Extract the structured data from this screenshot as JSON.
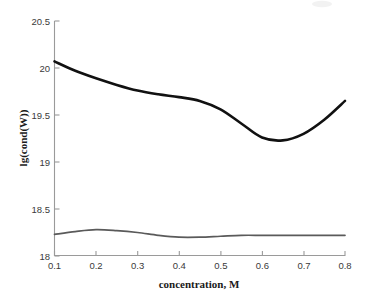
{
  "chart_data": {
    "type": "line",
    "title": "",
    "xlabel": "concentration, M",
    "ylabel": "lg(cond(W))",
    "xlim": [
      0.1,
      0.8
    ],
    "ylim": [
      18.0,
      20.5
    ],
    "grid": false,
    "legend_position": "none",
    "xticks": [
      "0.1",
      "0.2",
      "0.3",
      "0.4",
      "0.5",
      "0.6",
      "0.7",
      "0.8"
    ],
    "xtick_values": [
      0.1,
      0.2,
      0.3,
      0.4,
      0.5,
      0.6,
      0.7,
      0.8
    ],
    "yticks": [
      "18",
      "18.5",
      "19",
      "19.5",
      "20",
      "20.5"
    ],
    "ytick_values": [
      18,
      18.5,
      19,
      19.5,
      20,
      20.5
    ],
    "x": [
      0.1,
      0.15,
      0.2,
      0.25,
      0.3,
      0.35,
      0.4,
      0.45,
      0.5,
      0.55,
      0.6,
      0.65,
      0.7,
      0.75,
      0.8
    ],
    "series": [
      {
        "name": "lg(cond) upper branch",
        "color": "#111111",
        "linewidth": 2.6,
        "values": [
          20.07,
          19.97,
          19.89,
          19.82,
          19.76,
          19.72,
          19.69,
          19.65,
          19.56,
          19.41,
          19.26,
          19.23,
          19.3,
          19.45,
          19.65
        ]
      },
      {
        "name": "lg(cond) lower branch",
        "color": "#5a5a5a",
        "linewidth": 1.7,
        "values": [
          18.23,
          18.26,
          18.28,
          18.27,
          18.25,
          18.22,
          18.2,
          18.2,
          18.21,
          18.22,
          18.22,
          18.22,
          18.22,
          18.22,
          18.22
        ]
      }
    ]
  },
  "axes": {
    "x_label": "concentration, M",
    "y_label": "lg(cond(W))",
    "x_tick_labels": [
      "0.1",
      "0.2",
      "0.3",
      "0.4",
      "0.5",
      "0.6",
      "0.7",
      "0.8"
    ],
    "y_tick_labels": [
      "18",
      "18.5",
      "19",
      "19.5",
      "20",
      "20.5"
    ]
  },
  "style": {
    "background": "#ffffff",
    "spine_color": "#9a9a9a",
    "primary_series_color": "#111111",
    "secondary_series_color": "#5a5a5a",
    "tick_label_color": "#3a3a3a",
    "axis_title_color": "#1a1a1a"
  }
}
